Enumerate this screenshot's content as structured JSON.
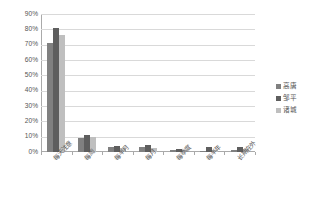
{
  "chart_data": {
    "type": "bar",
    "title": "",
    "xlabel": "",
    "ylabel": "",
    "ylim": [
      0,
      90
    ],
    "grid": true,
    "legend_position": "right",
    "ytick_labels": [
      "90%",
      "80%",
      "70%",
      "60%",
      "50%",
      "40%",
      "30%",
      "20%",
      "10%",
      "0%"
    ],
    "ytick_values": [
      90,
      80,
      70,
      60,
      50,
      40,
      30,
      20,
      10,
      0
    ],
    "categories": [
      "每天注意",
      "每周",
      "每半月",
      "每月",
      "每季度",
      "每半年",
      "长期在外"
    ],
    "series": [
      {
        "name": "高唐",
        "color": "#808080",
        "values": [
          71,
          9,
          3,
          3.5,
          1.5,
          0.5,
          1
        ]
      },
      {
        "name": "邹平",
        "color": "#5e5e5e",
        "values": [
          81,
          11,
          4,
          4.5,
          2,
          3,
          3
        ]
      },
      {
        "name": "诸城",
        "color": "#bfbfbf",
        "values": [
          76,
          10,
          2.5,
          2.5,
          1.5,
          1,
          2
        ]
      }
    ]
  },
  "legend": {
    "items": [
      {
        "label": "高唐"
      },
      {
        "label": "邹平"
      },
      {
        "label": "诸城"
      }
    ]
  }
}
